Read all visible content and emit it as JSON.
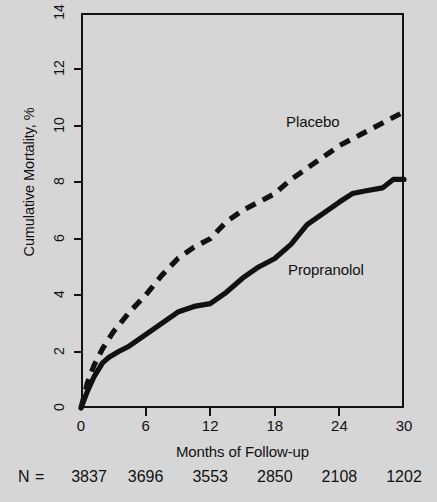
{
  "figure": {
    "background_color": "#d6d6d6",
    "ink_color": "#111111",
    "width": 437,
    "height": 502
  },
  "axes": {
    "y_title": "Cumulative Mortality, %",
    "x_title": "Months of Follow-up",
    "y_ticks": [
      "0",
      "2",
      "4",
      "6",
      "8",
      "10",
      "12",
      "14"
    ],
    "x_ticks": [
      "0",
      "6",
      "12",
      "18",
      "24",
      "30"
    ]
  },
  "series_labels": {
    "placebo": "Placebo",
    "propranolol": "Propranolol"
  },
  "n_row": {
    "label": "N =",
    "values": [
      "3837",
      "3696",
      "3553",
      "2850",
      "2108",
      "1202"
    ]
  },
  "chart_data": {
    "type": "line",
    "title": "",
    "subtitle": "",
    "xlabel": "Months of Follow-up",
    "ylabel": "Cumulative Mortality, %",
    "xlim": [
      0,
      30
    ],
    "ylim": [
      0,
      14
    ],
    "xticks": [
      0,
      6,
      12,
      18,
      24,
      30
    ],
    "yticks": [
      0,
      2,
      4,
      6,
      8,
      10,
      12,
      14
    ],
    "grid": false,
    "legend": "inline-annotation",
    "annotations": [
      {
        "text": "Placebo",
        "x": 19.0,
        "y": 11.2
      },
      {
        "text": "Propranolol",
        "x": 19.2,
        "y": 5.9
      }
    ],
    "n_at_risk": {
      "label": "N =",
      "x": [
        0,
        6,
        12,
        18,
        24,
        30
      ],
      "values": [
        3837,
        3696,
        3553,
        2850,
        2108,
        1202
      ]
    },
    "series": [
      {
        "name": "Placebo",
        "style": "dashed",
        "x": [
          0,
          0.6,
          1.2,
          2.0,
          3.0,
          4.5,
          6.0,
          7.5,
          9.0,
          10.5,
          12.0,
          13.5,
          15.0,
          16.5,
          18.0,
          19.5,
          21.0,
          22.5,
          24.0,
          25.5,
          27.0,
          28.5,
          30.0
        ],
        "values": [
          0.0,
          0.9,
          1.5,
          2.1,
          2.7,
          3.4,
          4.0,
          4.7,
          5.3,
          5.7,
          6.0,
          6.6,
          7.0,
          7.3,
          7.6,
          8.1,
          8.5,
          8.9,
          9.3,
          9.6,
          9.9,
          10.2,
          10.5
        ]
      },
      {
        "name": "Propranolol",
        "style": "solid",
        "x": [
          0,
          0.6,
          1.2,
          2.0,
          2.6,
          3.5,
          4.5,
          6.0,
          7.5,
          9.0,
          10.5,
          12.0,
          13.5,
          15.0,
          16.5,
          18.0,
          19.5,
          21.0,
          22.5,
          24.0,
          25.2,
          26.5,
          28.0,
          29.0,
          30.0
        ],
        "values": [
          0.0,
          0.6,
          1.1,
          1.6,
          1.8,
          2.0,
          2.2,
          2.6,
          3.0,
          3.4,
          3.6,
          3.7,
          4.1,
          4.6,
          5.0,
          5.3,
          5.8,
          6.5,
          6.9,
          7.3,
          7.6,
          7.7,
          7.8,
          8.1,
          8.1
        ]
      }
    ]
  }
}
